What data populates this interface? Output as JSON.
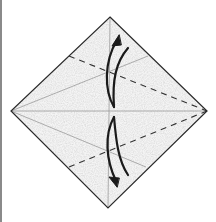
{
  "diagram": {
    "type": "origami-fold-step",
    "caption": "Fold top and bottom edges to the center crease, then unfold",
    "colors": {
      "paper": "#f4f4f4",
      "outline": "#2a2a2a",
      "crease": "#9a9a9a",
      "fold_line": "#333333",
      "arrow": "#1a1a1a",
      "frame_border": "#8a8a8a"
    },
    "shapes": {
      "square_vertices": [
        [
          110,
          17
        ],
        [
          207,
          111
        ],
        [
          108,
          208
        ],
        [
          11,
          111
        ]
      ],
      "valley_folds": [
        {
          "from": [
            69,
            56
          ],
          "to": [
            207,
            111
          ]
        },
        {
          "from": [
            69,
            167
          ],
          "to": [
            207,
            111
          ]
        }
      ],
      "creases": [
        {
          "from": [
            11,
            111
          ],
          "to": [
            207,
            111
          ]
        },
        {
          "from": [
            110,
            17
          ],
          "to": [
            108,
            208
          ]
        },
        {
          "from": [
            11,
            111
          ],
          "to": [
            148,
            56
          ]
        },
        {
          "from": [
            11,
            111
          ],
          "to": [
            146,
            167
          ]
        }
      ],
      "arrows": [
        {
          "name": "fold-up-arrow",
          "direction": "up"
        },
        {
          "name": "fold-down-arrow",
          "direction": "down"
        }
      ]
    }
  }
}
